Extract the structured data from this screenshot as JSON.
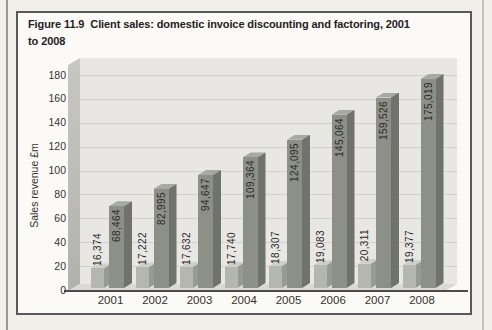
{
  "figure": {
    "title_lines": [
      "Figure 11.9  Client sales: domestic invoice discounting and factoring, 2001",
      "to 2008"
    ]
  },
  "chart_data": {
    "type": "bar",
    "xlabel": "",
    "ylabel": "Sales revenue £m",
    "categories": [
      "2001",
      "2002",
      "2003",
      "2004",
      "2005",
      "2006",
      "2007",
      "2008"
    ],
    "series": [
      {
        "name": "Factoring",
        "values": [
          16374,
          17222,
          17632,
          17740,
          18307,
          19083,
          20311,
          19377
        ],
        "labels": [
          "16,374",
          "17,222",
          "17,632",
          "17,740",
          "18,307",
          "19,083",
          "20,311",
          "19,377"
        ]
      },
      {
        "name": "Invoice discounting",
        "values": [
          68464,
          82995,
          94647,
          109364,
          124095,
          145064,
          159526,
          175019
        ],
        "labels": [
          "68,464",
          "82,995",
          "94,647",
          "109,364",
          "124,095",
          "145,064",
          "159,526",
          "175,019"
        ]
      }
    ],
    "ylim": [
      0,
      180
    ],
    "yticks": [
      0,
      20,
      40,
      60,
      80,
      100,
      120,
      140,
      160,
      180
    ],
    "grid": true,
    "legend_position": "top-left-inside",
    "bar_style": "3d",
    "value_label_rotation": "vertical"
  },
  "colors": {
    "page_bg": "#f2efeb",
    "figure_bg": "#fbfaf7",
    "figure_border": "#58595b",
    "plot_bg": "#e9e7e3",
    "gridline": "#d3d1cd",
    "wall": "#b3b1ad",
    "wall_light": "#c9c7c3",
    "floor": "#dbd9d5",
    "axis_line": "#4c4c4e",
    "text_dark": "#26211f",
    "f_front": "#b4b6b0",
    "f_top": "#cdcfc9",
    "f_side": "#989a94",
    "i_front": "#8d9088",
    "i_top": "#a7aaa1",
    "i_side": "#70736b"
  }
}
